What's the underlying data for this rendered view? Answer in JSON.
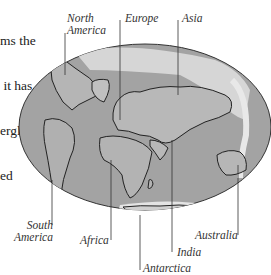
{
  "caption": {
    "lines": [
      "ms the",
      " it has",
      "erglacial)",
      "ed"
    ]
  },
  "labels": {
    "north_america": [
      "North",
      "America"
    ],
    "europe": "Europe",
    "asia": "Asia",
    "south_america": [
      "South",
      "America"
    ],
    "africa": "Africa",
    "india": "India",
    "australia": "Australia",
    "antarctica": "Antarctica"
  },
  "colors": {
    "ocean": "#9a9a9a",
    "land": "#b8b8b8",
    "ice": "#e8e8e8",
    "outline": "#222222"
  }
}
